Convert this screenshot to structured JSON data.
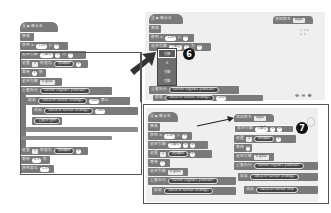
{
  "left_panel": {
    "hat_block": {
      "label": "当 ▶ 被点击"
    },
    "blocks": [
      {
        "label": "换成",
        "args": []
      },
      {
        "label": "移到 x:",
        "args": [
          "120",
          "y:",
          "0"
        ]
      },
      {
        "label": "设定引脚",
        "args": [
          "引脚号",
          "6",
          "为",
          "0"
        ]
      },
      {
        "label": "设置",
        "args": [
          "1",
          "的值为",
          "模拟输出",
          "0"
        ]
      },
      {
        "label": "等待",
        "args": [
          "1",
          "秒"
        ]
      },
      {
        "label": "设定引脚",
        "args": [
          "0 glow"
        ]
      },
      {
        "label": "重复执行",
        "args": [
          "sensor Digital1",
          "pressed?"
        ]
      },
      {
        "label": "如果",
        "args": [
          "value of sensor Analog1",
          "100",
          "那么"
        ]
      },
      {
        "label": "说出",
        "args": [
          "value of sensor Analog1",
          "100"
        ]
      },
      {
        "label": "重复执行直到",
        "args": []
      },
      {
        "label": "设置",
        "args": [
          "1",
          "的值为",
          "模拟输出",
          "0"
        ]
      },
      {
        "label": "等待",
        "args": [
          "0.1",
          "秒"
        ]
      },
      {
        "label": "移到某位",
        "args": [
          "1.0"
        ]
      }
    ]
  },
  "top_right_panel": {
    "hat_block": {
      "label": "当 ▶ 被点击"
    },
    "apps_block": {
      "label": "添加积木",
      "dropdown": "Apps"
    },
    "coords": [
      "x: 1.0",
      "y: 1"
    ],
    "badge": "6",
    "pin_menu": {
      "items": [
        "引脚",
        "6",
        "引脚",
        "引脚"
      ],
      "selected_index": 0
    },
    "blocks": [
      {
        "label": "换成",
        "args": []
      },
      {
        "label": "移到 x:",
        "args": [
          "120",
          "y:",
          "0"
        ]
      },
      {
        "label": "设定引脚",
        "args": [
          "引脚号",
          "6",
          "为",
          "0"
        ]
      },
      {
        "label": "重复执行",
        "args": [
          "sensor Digital1",
          "pressed?"
        ]
      },
      {
        "label": "如果",
        "args": [
          "value of sensor Analog1",
          "100",
          "那么"
        ]
      }
    ],
    "zoom_controls": {
      "zoom_out": "🔍-",
      "reset": "=",
      "zoom_in": "🔍+"
    }
  },
  "bottom_right_panel": {
    "left_script": {
      "hat_block": {
        "label": "当 ▶ 被点击"
      },
      "blocks": [
        {
          "label": "换成",
          "args": []
        },
        {
          "label": "移到 x:",
          "args": [
            "120",
            "y:",
            "0"
          ]
        },
        {
          "label": "设定引脚",
          "args": [
            "引脚号",
            "6",
            "为",
            "0"
          ]
        },
        {
          "label": "设置",
          "args": [
            "1",
            "的值为",
            "模拟输出",
            "0"
          ]
        },
        {
          "label": "等待",
          "args": [
            "1"
          ]
        },
        {
          "label": "设定引脚",
          "args": [
            "0 glow"
          ]
        },
        {
          "label": "重复执行",
          "args": [
            "sensor Digital1",
            "pressed?"
          ]
        },
        {
          "label": "如果",
          "args": [
            "value of sensor Analog1"
          ]
        }
      ]
    },
    "right_script": {
      "apps_block": {
        "label": "添加积木",
        "dropdown": "Apps"
      },
      "badge": "7",
      "blocks": [
        {
          "label": "设定引脚",
          "args": [
            "引脚号",
            "6",
            "为",
            "0"
          ]
        },
        {
          "label": "设置",
          "args": [
            "1",
            "的值为",
            "模拟输出",
            "0"
          ]
        },
        {
          "label": "等待",
          "args": [
            "0"
          ]
        },
        {
          "label": "设定引脚",
          "args": [
            "0 glow"
          ]
        },
        {
          "label": "重复执行",
          "args": [
            "sensor Digital1",
            "pressed?"
          ]
        },
        {
          "label": "如果",
          "args": [
            "value of sensor Analog1"
          ]
        },
        {
          "label": "说出",
          "args": [
            "value of sensor Ana"
          ]
        }
      ]
    }
  }
}
